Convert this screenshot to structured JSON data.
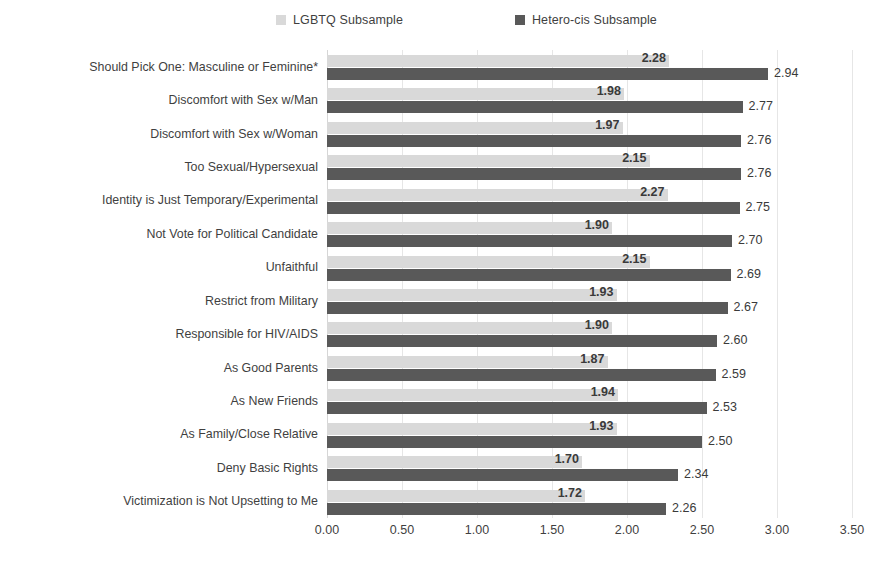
{
  "legend": {
    "position": "top-center",
    "entries": [
      {
        "label": "LGBTQ Subsample",
        "color": "#d9d9d9",
        "swatch": "legend-swatch-light"
      },
      {
        "label": "Hetero-cis Subsample",
        "color": "#595959",
        "swatch": "legend-swatch-dark"
      }
    ]
  },
  "chart_data": {
    "type": "bar",
    "orientation": "horizontal",
    "title": "",
    "subtitle": "",
    "xlabel": "",
    "ylabel": "",
    "xlim": [
      0,
      3.5
    ],
    "xticks": [
      "0.00",
      "0.50",
      "1.00",
      "1.50",
      "2.00",
      "2.50",
      "3.00",
      "3.50"
    ],
    "xtick_values": [
      0,
      0.5,
      1,
      1.5,
      2,
      2.5,
      3,
      3.5
    ],
    "grid": "vertical",
    "legend_position": "top-center",
    "categories": [
      "Should Pick One: Masculine or Feminine*",
      "Discomfort with Sex w/Man",
      "Discomfort with Sex w/Woman",
      "Too Sexual/Hypersexual",
      "Identity is Just Temporary/Experimental",
      "Not Vote for Political Candidate",
      "Unfaithful",
      "Restrict from Military",
      "Responsible for HIV/AIDS",
      "As Good Parents",
      "As New Friends",
      "As Family/Close Relative",
      "Deny Basic Rights",
      "Victimization is Not Upsetting to Me"
    ],
    "series": [
      {
        "name": "LGBTQ Subsample",
        "color": "#d9d9d9",
        "values": [
          2.28,
          1.98,
          1.97,
          2.15,
          2.27,
          1.9,
          2.15,
          1.93,
          1.9,
          1.87,
          1.94,
          1.93,
          1.7,
          1.72
        ],
        "labels": [
          "2.28",
          "1.98",
          "1.97",
          "2.15",
          "2.27",
          "1.90",
          "2.15",
          "1.93",
          "1.90",
          "1.87",
          "1.94",
          "1.93",
          "1.70",
          "1.72"
        ]
      },
      {
        "name": "Hetero-cis Subsample",
        "color": "#595959",
        "values": [
          2.94,
          2.77,
          2.76,
          2.76,
          2.75,
          2.7,
          2.69,
          2.67,
          2.6,
          2.59,
          2.53,
          2.5,
          2.34,
          2.26
        ],
        "labels": [
          "2.94",
          "2.77",
          "2.76",
          "2.76",
          "2.75",
          "2.70",
          "2.69",
          "2.67",
          "2.60",
          "2.59",
          "2.53",
          "2.50",
          "2.34",
          "2.26"
        ]
      }
    ]
  }
}
